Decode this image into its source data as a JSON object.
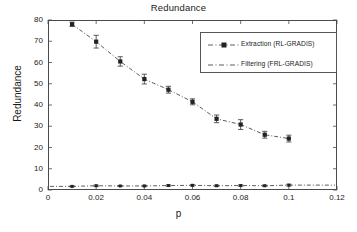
{
  "chart_data": {
    "type": "line",
    "title": "Redundance",
    "xlabel": "p",
    "ylabel": "Redundance",
    "xlim": [
      0,
      0.12
    ],
    "ylim": [
      0,
      80
    ],
    "xticks": [
      "0",
      "0.02",
      "0.04",
      "0.06",
      "0.08",
      "0.1",
      "0.12"
    ],
    "xtick_values": [
      0,
      0.02,
      0.04,
      0.06,
      0.08,
      0.1,
      0.12
    ],
    "yticks": [
      "0",
      "10",
      "20",
      "30",
      "40",
      "50",
      "60",
      "70",
      "80"
    ],
    "ytick_values": [
      0,
      10,
      20,
      30,
      40,
      50,
      60,
      70,
      80
    ],
    "grid": false,
    "legend_position": "upper right",
    "x": [
      0.01,
      0.02,
      0.03,
      0.04,
      0.05,
      0.06,
      0.07,
      0.08,
      0.09,
      0.1
    ],
    "series": [
      {
        "name": "Extraction (RL-GRADIS)",
        "marker": "square",
        "linestyle": "dash-dot",
        "color": "#333333",
        "values": [
          78.0,
          69.8,
          60.5,
          52.2,
          47.2,
          41.5,
          33.5,
          30.8,
          26.0,
          24.2
        ],
        "errors": [
          1.0,
          3.0,
          2.2,
          2.3,
          1.6,
          1.4,
          1.8,
          2.3,
          1.6,
          1.6
        ]
      },
      {
        "name": "Filtering (FRL-GRADIS)",
        "marker": "square",
        "linestyle": "dash-dot",
        "color": "#333333",
        "values": [
          1.7,
          2.0,
          1.9,
          1.9,
          2.1,
          2.2,
          2.0,
          2.1,
          2.0,
          2.3
        ],
        "errors": [
          0.2,
          0.3,
          0.2,
          0.3,
          0.3,
          0.3,
          0.3,
          0.3,
          0.3,
          0.4
        ]
      }
    ]
  },
  "legend": {
    "entries": [
      {
        "label": "Extraction (RL-GRADIS)"
      },
      {
        "label": "Filtering (FRL-GRADIS)"
      }
    ]
  }
}
